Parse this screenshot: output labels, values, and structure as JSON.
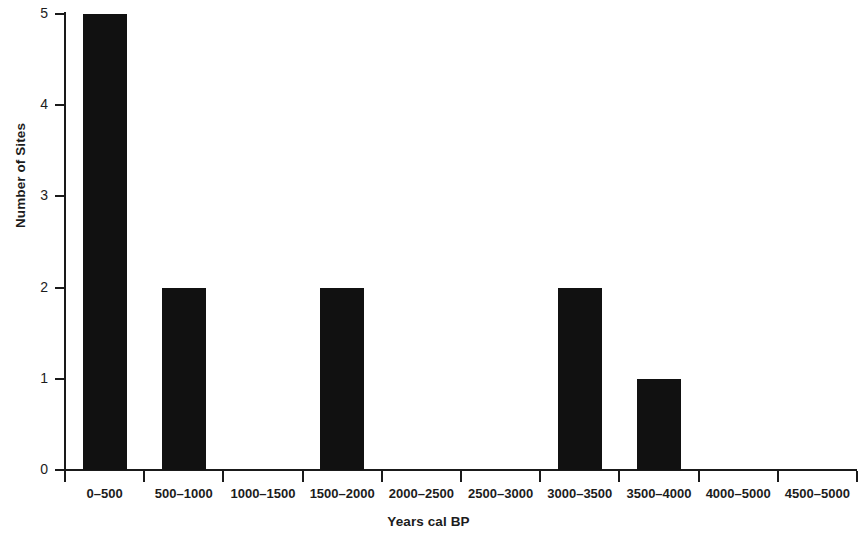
{
  "chart_data": {
    "type": "bar",
    "title": "",
    "xlabel": "Years cal BP",
    "ylabel": "Number of Sites",
    "categories": [
      "0–500",
      "500–1000",
      "1000–1500",
      "1500–2000",
      "2000–2500",
      "2500–3000",
      "3000–3500",
      "3500–4000",
      "4000–5000",
      "4500–5000"
    ],
    "values": [
      5,
      2,
      0,
      2,
      0,
      0,
      2,
      1,
      0,
      0
    ],
    "ylim": [
      0,
      5
    ],
    "yticks": [
      0,
      1,
      2,
      3,
      4,
      5
    ],
    "ytick_labels": [
      "0",
      "1",
      "2",
      "3",
      "4",
      "5"
    ],
    "grid": false,
    "legend": null,
    "bar_color": "#111111",
    "axis_color": "#1a1a1a"
  }
}
